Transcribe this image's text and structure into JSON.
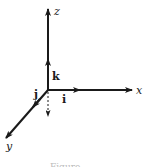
{
  "diagram": {
    "type": "3d-coordinate-axes",
    "axes": [
      {
        "name": "x",
        "label": "x"
      },
      {
        "name": "y",
        "label": "y"
      },
      {
        "name": "z",
        "label": "z"
      }
    ],
    "unit_vectors": [
      {
        "name": "i",
        "label": "i",
        "axis": "x"
      },
      {
        "name": "j",
        "label": "j",
        "axis": "y"
      },
      {
        "name": "k",
        "label": "k",
        "axis": "z"
      }
    ],
    "caption": "Figure"
  },
  "colors": {
    "line": "#1a1a1a",
    "background": "#ffffff"
  }
}
